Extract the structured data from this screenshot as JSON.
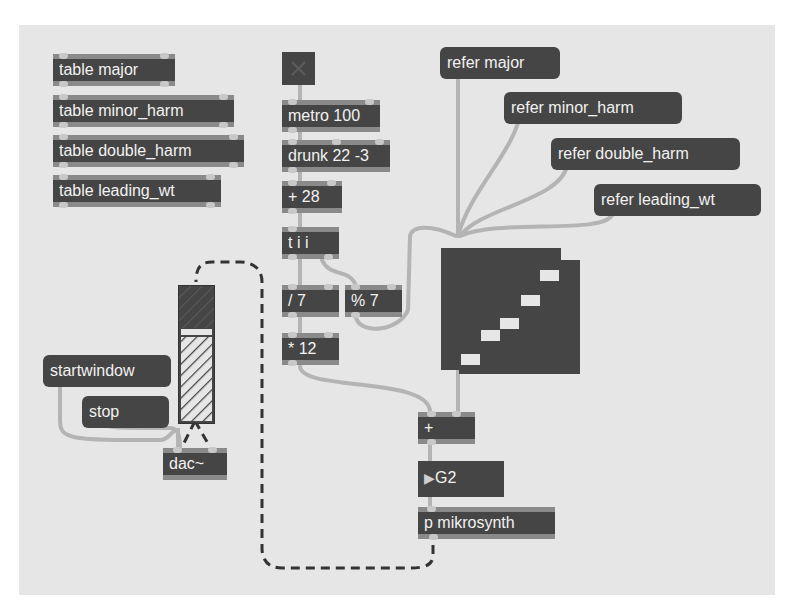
{
  "patch": {
    "background": "#e6e6e6",
    "object_color": "#454545",
    "text_color": "#f2f2f2",
    "cord_color": "#b4b4b4",
    "signal_cord_color": "#333333"
  },
  "tables": [
    {
      "label": "table major"
    },
    {
      "label": "table minor_harm"
    },
    {
      "label": "table double_harm"
    },
    {
      "label": "table leading_wt"
    }
  ],
  "toggle": {
    "state": "off",
    "icon": "x-icon"
  },
  "chain": {
    "metro": "metro 100",
    "drunk": "drunk 22 -3",
    "add": "+ 28",
    "trigger": "t i i",
    "divide": "/ 7",
    "modulo": "% 7",
    "multiply": "* 12"
  },
  "messages": {
    "refer_major": "refer major",
    "refer_minor": "refer minor_harm",
    "refer_double": "refer double_harm",
    "refer_leading": "refer leading_wt",
    "startwindow": "startwindow",
    "stop": "stop"
  },
  "lower": {
    "plus": "+",
    "number": "G2",
    "number_arrow": "▶",
    "subpatch": "p mikrosynth",
    "dac": "dac~"
  },
  "multislider": {
    "bars": [
      {
        "x": 20,
        "y": 106
      },
      {
        "x": 40,
        "y": 82
      },
      {
        "x": 59,
        "y": 70
      },
      {
        "x": 80,
        "y": 47
      },
      {
        "x": 99,
        "y": 22
      }
    ]
  },
  "gain_slider": {
    "level_percent": 72
  }
}
